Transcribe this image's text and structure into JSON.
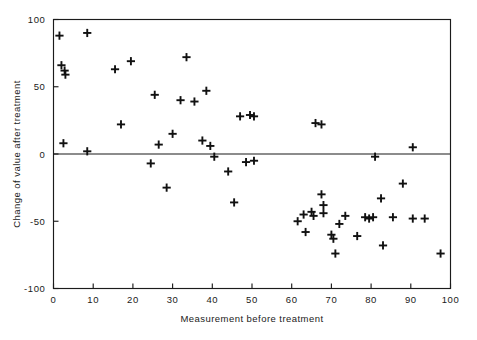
{
  "chart_data": {
    "type": "scatter",
    "title": "",
    "xlabel": "Measurement before treatment",
    "ylabel": "Change of value after treatment",
    "xlim": [
      0,
      100
    ],
    "ylim": [
      -100,
      100
    ],
    "xticks": [
      0,
      10,
      20,
      30,
      40,
      50,
      60,
      70,
      80,
      90,
      100
    ],
    "yticks": [
      100,
      50,
      0,
      -50,
      -100
    ],
    "xtick_labels": [
      "0",
      "10",
      "20",
      "30",
      "40",
      "50",
      "60",
      "70",
      "80",
      "90",
      "100"
    ],
    "ytick_labels": [
      "100",
      "50",
      "0",
      "-50",
      "-100"
    ],
    "grid": false,
    "legend": null,
    "marker": "plus",
    "marker_color": "#111111",
    "reference_lines": [
      {
        "axis": "y",
        "value": 0,
        "label": "zero-change-line"
      }
    ],
    "n_points": 57,
    "points": [
      {
        "x": 1.5,
        "y": 88
      },
      {
        "x": 8.5,
        "y": 90
      },
      {
        "x": 2.0,
        "y": 66
      },
      {
        "x": 2.8,
        "y": 62
      },
      {
        "x": 3.0,
        "y": 59
      },
      {
        "x": 15.5,
        "y": 63
      },
      {
        "x": 2.5,
        "y": 8
      },
      {
        "x": 8.5,
        "y": 2
      },
      {
        "x": 19.5,
        "y": 69
      },
      {
        "x": 17.0,
        "y": 22
      },
      {
        "x": 25.5,
        "y": 44
      },
      {
        "x": 32.0,
        "y": 40
      },
      {
        "x": 35.5,
        "y": 39
      },
      {
        "x": 33.5,
        "y": 72
      },
      {
        "x": 26.5,
        "y": 7
      },
      {
        "x": 30.0,
        "y": 15
      },
      {
        "x": 24.5,
        "y": -7
      },
      {
        "x": 28.5,
        "y": -25
      },
      {
        "x": 38.5,
        "y": 47
      },
      {
        "x": 37.5,
        "y": 10
      },
      {
        "x": 39.5,
        "y": 6
      },
      {
        "x": 40.5,
        "y": -2
      },
      {
        "x": 44.0,
        "y": -13
      },
      {
        "x": 47.0,
        "y": 28
      },
      {
        "x": 49.5,
        "y": 29
      },
      {
        "x": 50.5,
        "y": 28
      },
      {
        "x": 48.5,
        "y": -6
      },
      {
        "x": 50.5,
        "y": -5
      },
      {
        "x": 45.5,
        "y": -36
      },
      {
        "x": 61.5,
        "y": -50
      },
      {
        "x": 63.0,
        "y": -45
      },
      {
        "x": 65.0,
        "y": -43
      },
      {
        "x": 65.5,
        "y": -46
      },
      {
        "x": 63.5,
        "y": -58
      },
      {
        "x": 66.0,
        "y": 23
      },
      {
        "x": 67.5,
        "y": 22
      },
      {
        "x": 67.5,
        "y": -30
      },
      {
        "x": 68.0,
        "y": -38
      },
      {
        "x": 68.0,
        "y": -44
      },
      {
        "x": 70.0,
        "y": -60
      },
      {
        "x": 70.5,
        "y": -63
      },
      {
        "x": 71.0,
        "y": -74
      },
      {
        "x": 73.5,
        "y": -46
      },
      {
        "x": 76.5,
        "y": -61
      },
      {
        "x": 78.5,
        "y": -47
      },
      {
        "x": 79.5,
        "y": -48
      },
      {
        "x": 80.5,
        "y": -47
      },
      {
        "x": 81.0,
        "y": -2
      },
      {
        "x": 82.5,
        "y": -33
      },
      {
        "x": 83.0,
        "y": -68
      },
      {
        "x": 85.5,
        "y": -47
      },
      {
        "x": 88.0,
        "y": -22
      },
      {
        "x": 90.5,
        "y": 5
      },
      {
        "x": 90.5,
        "y": -48
      },
      {
        "x": 93.5,
        "y": -48
      },
      {
        "x": 97.5,
        "y": -74
      },
      {
        "x": 72.0,
        "y": -52
      }
    ]
  },
  "axes": {
    "x_axis_name": "Measurement before treatment",
    "y_axis_name": "Change of value after treatment"
  }
}
